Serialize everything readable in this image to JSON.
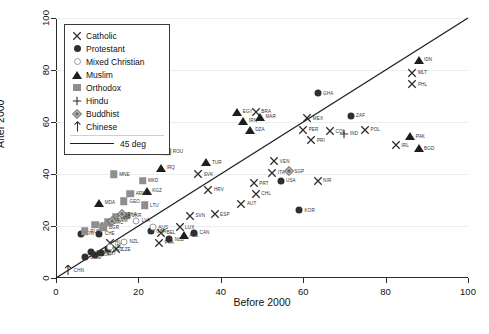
{
  "chart_data": {
    "type": "scatter",
    "title": "",
    "xlabel": "Before 2000",
    "ylabel": "After 2000",
    "xlim": [
      0,
      100
    ],
    "ylim": [
      0,
      100
    ],
    "xticks": [
      0,
      20,
      40,
      60,
      80,
      100
    ],
    "yticks": [
      0,
      20,
      40,
      60,
      80,
      100
    ],
    "grid": true,
    "grid_axis": "y",
    "legend_position": "top-left",
    "reference_line": {
      "label": "45 deg",
      "slope": 1,
      "intercept": 0
    },
    "legend": [
      {
        "key": "catholic",
        "label": "Catholic",
        "marker": "x-cross"
      },
      {
        "key": "protestant",
        "label": "Protestant",
        "marker": "filled-circle"
      },
      {
        "key": "mixed",
        "label": "Mixed Christian",
        "marker": "open-circle"
      },
      {
        "key": "muslim",
        "label": "Muslim",
        "marker": "filled-triangle"
      },
      {
        "key": "orthodox",
        "label": "Orthodox",
        "marker": "filled-square"
      },
      {
        "key": "hindu",
        "label": "Hindu",
        "marker": "plus"
      },
      {
        "key": "buddhist",
        "label": "Buddhist",
        "marker": "diamond"
      },
      {
        "key": "chinese",
        "label": "Chinese",
        "marker": "arrow-up"
      }
    ],
    "series": [
      {
        "name": "Catholic",
        "group": "catholic",
        "points": [
          {
            "label": "MLT",
            "x": 86.5,
            "y": 79.0
          },
          {
            "label": "PHL",
            "x": 86.5,
            "y": 74.5
          },
          {
            "label": "POL",
            "x": 75.0,
            "y": 57.0
          },
          {
            "label": "IRL",
            "x": 82.5,
            "y": 51.0
          },
          {
            "label": "MEX",
            "x": 61.0,
            "y": 61.5
          },
          {
            "label": "PER",
            "x": 60.0,
            "y": 57.0
          },
          {
            "label": "COL",
            "x": 66.5,
            "y": 56.5
          },
          {
            "label": "PRI",
            "x": 62.0,
            "y": 53.0
          },
          {
            "label": "BRA",
            "x": 48.5,
            "y": 64.0
          },
          {
            "label": "VEN",
            "x": 53.0,
            "y": 45.0
          },
          {
            "label": "ITA",
            "x": 52.5,
            "y": 40.5
          },
          {
            "label": "NIR",
            "x": 63.5,
            "y": 37.5
          },
          {
            "label": "PRT",
            "x": 48.0,
            "y": 36.5
          },
          {
            "label": "CHL",
            "x": 48.5,
            "y": 32.5
          },
          {
            "label": "AUT",
            "x": 45.0,
            "y": 28.5
          },
          {
            "label": "ESP",
            "x": 38.5,
            "y": 24.5
          },
          {
            "label": "SVN",
            "x": 32.5,
            "y": 24.0
          },
          {
            "label": "HRV",
            "x": 37.0,
            "y": 34.0
          },
          {
            "label": "SVK",
            "x": 34.5,
            "y": 40.0
          },
          {
            "label": "LUX",
            "x": 30.0,
            "y": 19.5
          },
          {
            "label": "FRA",
            "x": 25.0,
            "y": 13.5
          },
          {
            "label": "BEL",
            "x": 25.5,
            "y": 17.5
          },
          {
            "label": "CZE",
            "x": 14.5,
            "y": 11.0
          },
          {
            "label": "HUN",
            "x": 13.0,
            "y": 13.5
          }
        ]
      },
      {
        "name": "Protestant",
        "group": "protestant",
        "points": [
          {
            "label": "ZAF",
            "x": 71.5,
            "y": 62.5
          },
          {
            "label": "GHA",
            "x": 63.5,
            "y": 71.0
          },
          {
            "label": "KOR",
            "x": 59.0,
            "y": 26.0
          },
          {
            "label": "USA",
            "x": 54.5,
            "y": 37.5
          },
          {
            "label": "CAN",
            "x": 33.5,
            "y": 17.5
          },
          {
            "label": "NLD",
            "x": 27.5,
            "y": 15.0
          },
          {
            "label": "GBR",
            "x": 23.0,
            "y": 18.0
          },
          {
            "label": "CHE",
            "x": 10.5,
            "y": 17.0
          },
          {
            "label": "FIN",
            "x": 6.0,
            "y": 17.0
          },
          {
            "label": "DNK",
            "x": 8.5,
            "y": 10.0
          },
          {
            "label": "NOR",
            "x": 9.5,
            "y": 9.0
          },
          {
            "label": "SWE",
            "x": 7.0,
            "y": 8.0
          },
          {
            "label": "DEU",
            "x": 12.5,
            "y": 11.0
          },
          {
            "label": "EST",
            "x": 11.0,
            "y": 9.5
          }
        ]
      },
      {
        "name": "Mixed Christian",
        "group": "mixed",
        "points": [
          {
            "label": "LVA",
            "x": 19.5,
            "y": 22.0
          },
          {
            "label": "NZL",
            "x": 16.5,
            "y": 14.0
          },
          {
            "label": "ISL",
            "x": 13.0,
            "y": 12.0
          },
          {
            "label": "AUS",
            "x": 23.5,
            "y": 19.5
          }
        ]
      },
      {
        "name": "Muslim",
        "group": "muslim",
        "points": [
          {
            "label": "IDN",
            "x": 88.0,
            "y": 84.0
          },
          {
            "label": "PAK",
            "x": 86.0,
            "y": 54.5
          },
          {
            "label": "BGD",
            "x": 88.0,
            "y": 50.0
          },
          {
            "label": "MAR",
            "x": 49.5,
            "y": 62.0
          },
          {
            "label": "EGY",
            "x": 44.0,
            "y": 64.0
          },
          {
            "label": "DZA",
            "x": 47.0,
            "y": 57.0
          },
          {
            "label": "IRN",
            "x": 45.5,
            "y": 60.5
          },
          {
            "label": "TUR",
            "x": 36.5,
            "y": 44.5
          },
          {
            "label": "IRQ",
            "x": 25.5,
            "y": 42.5
          },
          {
            "label": "ALB",
            "x": 31.0,
            "y": 16.5
          },
          {
            "label": "MDA",
            "x": 10.5,
            "y": 29.0
          },
          {
            "label": "KGZ",
            "x": 22.0,
            "y": 33.5
          }
        ]
      },
      {
        "name": "Orthodox",
        "group": "orthodox",
        "points": [
          {
            "label": "ROU",
            "x": 27.0,
            "y": 48.5
          },
          {
            "label": "MKD",
            "x": 21.0,
            "y": 37.5
          },
          {
            "label": "MNE",
            "x": 14.0,
            "y": 40.0
          },
          {
            "label": "ARM",
            "x": 18.0,
            "y": 32.5
          },
          {
            "label": "GEO",
            "x": 16.5,
            "y": 29.5
          },
          {
            "label": "LTU",
            "x": 21.5,
            "y": 28.0
          },
          {
            "label": "UKR",
            "x": 17.0,
            "y": 24.0
          },
          {
            "label": "SRB",
            "x": 14.5,
            "y": 23.5
          },
          {
            "label": "BLR",
            "x": 9.5,
            "y": 20.5
          },
          {
            "label": "RUS",
            "x": 7.0,
            "y": 18.0
          },
          {
            "label": "BGR",
            "x": 11.5,
            "y": 19.5
          },
          {
            "label": "GRC",
            "x": 12.5,
            "y": 21.5
          }
        ]
      },
      {
        "name": "Hindu",
        "group": "hindu",
        "points": [
          {
            "label": "IND",
            "x": 70.0,
            "y": 55.5
          }
        ]
      },
      {
        "name": "Buddhist",
        "group": "buddhist",
        "points": [
          {
            "label": "SGP",
            "x": 56.5,
            "y": 41.0
          },
          {
            "label": "THA",
            "x": 16.0,
            "y": 24.5
          },
          {
            "label": "VNM",
            "x": 13.5,
            "y": 22.0
          }
        ]
      },
      {
        "name": "Chinese",
        "group": "chinese",
        "points": [
          {
            "label": "CHN",
            "x": 3.0,
            "y": 3.0
          }
        ]
      }
    ]
  }
}
